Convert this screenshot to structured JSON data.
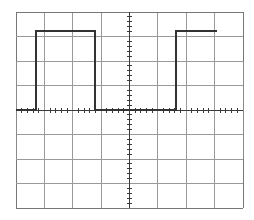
{
  "display": {
    "name": "oscilloscope-graticule",
    "width": 254,
    "height": 220,
    "background_color": "#ffffff"
  },
  "graticule": {
    "name": "graticule",
    "left": 16,
    "top": 12,
    "right": 243,
    "bottom": 208,
    "divisions_x": 8,
    "divisions_y": 8,
    "grid_color": "#9a9a9a",
    "grid_width": 1,
    "border_color": "#777777",
    "x_grid_positions": [
      16.0,
      44.4,
      72.8,
      101.1,
      129.5,
      157.9,
      186.3,
      214.6,
      243.0
    ],
    "y_grid_positions": [
      12.0,
      36.5,
      61.0,
      85.5,
      110.0,
      134.5,
      159.0,
      183.5,
      208.0
    ]
  },
  "center_axes": {
    "name": "center-axes",
    "horizontal_y": 110,
    "vertical_x": 129.5,
    "axis_color": "#3a3a3a",
    "axis_width": 1,
    "tick_subdivisions_per_division": 5,
    "tick_length_major": 9,
    "tick_length_minor": 5
  },
  "edge_markers": {
    "name": "edge-markers",
    "left_marker_x": 16,
    "right_marker_x": 243,
    "marker_color": "#8a8a8a",
    "left_span_top": 61,
    "left_span_bottom": 159,
    "right_span_top": 61,
    "right_span_bottom": 159
  },
  "chart_data": {
    "type": "line",
    "title": "",
    "subtitle": "",
    "xlabel": "",
    "ylabel": "",
    "grid": true,
    "legend_position": "none",
    "xlim": [
      16,
      243
    ],
    "ylim": [
      208,
      12
    ],
    "series": [
      {
        "name": "square-wave-trace",
        "color": "#333333",
        "line_width": 2,
        "points": [
          [
            16,
            110
          ],
          [
            36,
            110
          ],
          [
            36,
            31
          ],
          [
            95,
            31
          ],
          [
            95,
            110
          ],
          [
            176,
            110
          ],
          [
            176,
            31
          ],
          [
            217,
            31
          ]
        ],
        "annotations": {
          "baseline_y": 110,
          "high_level_y": 31,
          "amplitude_divisions": 3.2,
          "rising_edge_1_x": 36,
          "falling_edge_1_x": 95,
          "rising_edge_2_x": 176,
          "pulse_1_width_divisions": 2.1,
          "gap_width_divisions": 2.85,
          "trace_start_x": 16,
          "trace_end_x": 217
        }
      }
    ]
  }
}
